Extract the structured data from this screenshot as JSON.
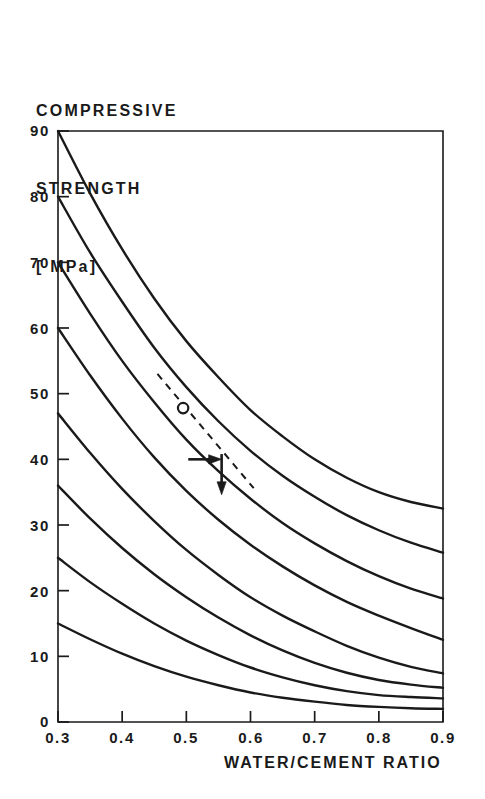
{
  "chart_data": {
    "type": "line",
    "title": "",
    "ylabel_lines": [
      "COMPRESSIVE",
      "STRENGTH",
      "[ MPa]"
    ],
    "ylabel": "COMPRESSIVE STRENGTH [ MPa]",
    "xlabel": "WATER/CEMENT RATIO",
    "xlim": [
      0.3,
      0.9
    ],
    "ylim": [
      0,
      90
    ],
    "grid": false,
    "legend": null,
    "xticks": [
      0.3,
      0.4,
      0.5,
      0.6,
      0.7,
      0.8,
      0.9
    ],
    "xtick_labels": [
      "0.3",
      "0.4",
      "0.5",
      "0.6",
      "0.7",
      "0.8",
      "0.9"
    ],
    "yticks": [
      0,
      10,
      20,
      30,
      40,
      50,
      60,
      70,
      80,
      90
    ],
    "ytick_labels": [
      "0",
      "10",
      "20",
      "30",
      "40",
      "50",
      "60",
      "70",
      "80",
      "90"
    ],
    "x": [
      0.3,
      0.35,
      0.4,
      0.45,
      0.5,
      0.55,
      0.6,
      0.65,
      0.7,
      0.75,
      0.8,
      0.85,
      0.9
    ],
    "series": [
      {
        "name": "curve-1",
        "values": [
          90.0,
          80.5,
          72.0,
          64.5,
          58.0,
          52.5,
          47.5,
          43.5,
          40.0,
          37.2,
          35.0,
          33.5,
          32.5
        ]
      },
      {
        "name": "curve-2",
        "values": [
          80.0,
          71.5,
          64.0,
          57.0,
          51.0,
          45.8,
          41.3,
          37.5,
          34.3,
          31.5,
          29.2,
          27.3,
          25.8
        ]
      },
      {
        "name": "curve-3",
        "values": [
          70.0,
          62.2,
          55.0,
          48.7,
          43.0,
          38.2,
          34.0,
          30.3,
          27.2,
          24.5,
          22.2,
          20.3,
          18.8
        ]
      },
      {
        "name": "curve-4",
        "values": [
          60.0,
          52.8,
          46.2,
          40.3,
          35.2,
          30.8,
          27.0,
          23.7,
          20.8,
          18.3,
          16.2,
          14.3,
          12.5
        ]
      },
      {
        "name": "curve-5",
        "values": [
          47.0,
          41.0,
          35.5,
          30.6,
          26.2,
          22.4,
          19.0,
          16.2,
          13.8,
          11.6,
          9.8,
          8.4,
          7.4
        ]
      },
      {
        "name": "curve-6",
        "values": [
          36.0,
          31.0,
          26.5,
          22.5,
          19.0,
          15.9,
          13.2,
          10.9,
          9.0,
          7.5,
          6.4,
          5.7,
          5.2
        ]
      },
      {
        "name": "curve-7",
        "values": [
          25.0,
          21.3,
          18.0,
          15.0,
          12.4,
          10.2,
          8.3,
          6.8,
          5.6,
          4.7,
          4.1,
          3.8,
          3.6
        ]
      },
      {
        "name": "curve-8",
        "values": [
          15.0,
          12.6,
          10.4,
          8.5,
          6.9,
          5.6,
          4.5,
          3.7,
          3.1,
          2.6,
          2.3,
          2.1,
          2.0
        ]
      }
    ],
    "annotations": [
      {
        "name": "trend-dashed-line",
        "style": "dashed",
        "x_start": 0.455,
        "y_start": 53.0,
        "x_end": 0.605,
        "y_end": 35.6
      },
      {
        "name": "open-circle-marker",
        "style": "open-circle",
        "x": 0.495,
        "y": 47.8
      },
      {
        "name": "horizontal-arrow-right",
        "style": "arrow",
        "x_start": 0.503,
        "y_start": 40.0,
        "x_end": 0.555,
        "y_end": 40.0
      },
      {
        "name": "vertical-arrow-down",
        "style": "arrow",
        "x_start": 0.555,
        "y_start": 40.8,
        "x_end": 0.555,
        "y_end": 34.6
      }
    ]
  },
  "axes": {
    "frame": {
      "left_px": 58,
      "right_px": 443,
      "top_px": 131,
      "bottom_px": 722
    },
    "colors": {
      "ink": "#1a1a1a",
      "background": "#ffffff"
    }
  }
}
